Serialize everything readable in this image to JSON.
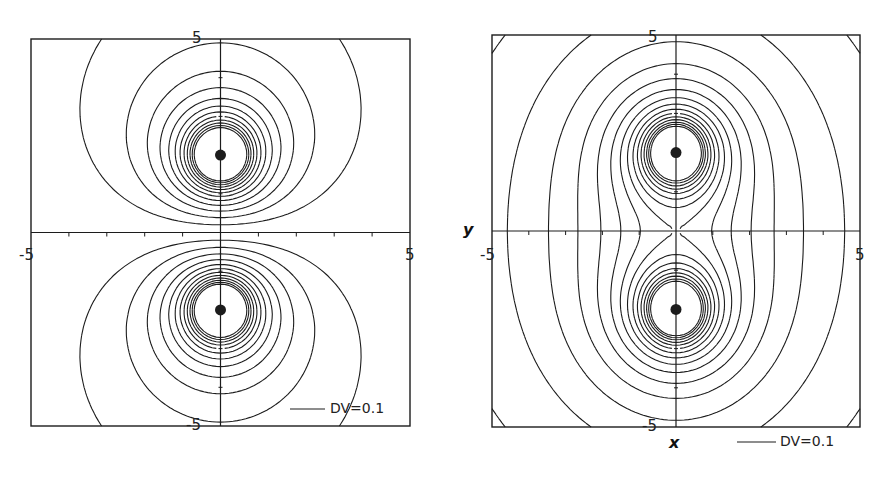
{
  "chart_data": [
    {
      "type": "contour",
      "title": "Equipotential lines of two opposite charges (dipole)",
      "xlabel": "",
      "ylabel": "",
      "xlim": [
        -5,
        5
      ],
      "ylim": [
        -5,
        5
      ],
      "tick_labels": {
        "x_min": "-5",
        "x_max": "5",
        "y_max": "5",
        "y_min": "-5"
      },
      "charges": [
        {
          "x": 0,
          "y": 2,
          "q": 1
        },
        {
          "x": 0,
          "y": -2,
          "q": -1
        }
      ],
      "contour_interval": 0.1,
      "max_abs_level": 1.2,
      "legend": "DV=0.1",
      "pixel_box": {
        "left": 31,
        "top": 39,
        "right": 410,
        "bottom": 426
      }
    },
    {
      "type": "contour",
      "title": "Equipotential lines of two like charges",
      "xlabel": "x",
      "ylabel": "y",
      "xlim": [
        -5,
        5
      ],
      "ylim": [
        -5,
        5
      ],
      "tick_labels": {
        "x_min": "-5",
        "x_max": "5",
        "y_max": "5",
        "y_min": "-5"
      },
      "charges": [
        {
          "x": 0,
          "y": 2,
          "q": 1
        },
        {
          "x": 0,
          "y": -2,
          "q": 1
        }
      ],
      "contour_interval": 0.1,
      "min_level": 0.3,
      "max_level": 1.7,
      "legend": "DV=0.1",
      "pixel_box": {
        "left": 492,
        "top": 35,
        "right": 860,
        "bottom": 427
      }
    }
  ],
  "left": {
    "tick_top": "5",
    "tick_bottom": "-5",
    "tick_left": "-5",
    "tick_right": "5",
    "legend": "DV=0.1"
  },
  "right": {
    "tick_top": "5",
    "tick_bottom": "-5",
    "tick_left": "-5",
    "tick_right": "5",
    "xlabel": "x",
    "ylabel": "y",
    "legend": "DV=0.1"
  },
  "colors": {
    "line": "#1c1c1c",
    "background": "#ffffff"
  }
}
